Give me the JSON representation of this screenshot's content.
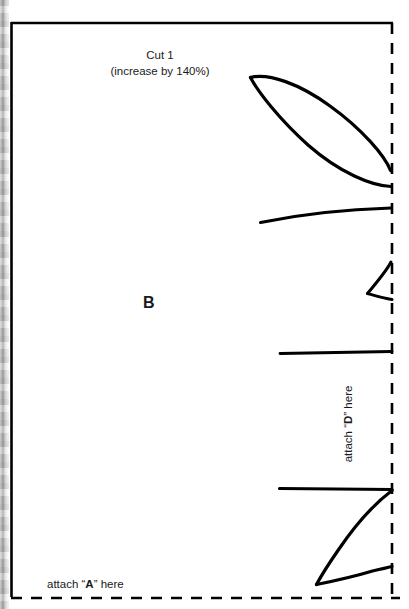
{
  "page": {
    "width": 409,
    "height": 609,
    "background_color": "#ffffff",
    "ink_color": "#000000",
    "text_color": "#1a1a1a"
  },
  "labels": {
    "cut_title": "Cut 1",
    "cut_subtitle": "(increase by 140%)",
    "piece_letter": "B",
    "attach_a_prefix": "attach “",
    "attach_a_letter": "A",
    "attach_a_suffix": "” here",
    "attach_d_prefix": "attach “",
    "attach_d_letter": "D",
    "attach_d_suffix": "” here"
  },
  "frame": {
    "solid_edges": [
      "left",
      "top"
    ],
    "dashed_edges": [
      "right",
      "bottom"
    ],
    "solid_left_x": 11,
    "solid_top_y": 22,
    "dashed_right_x": 392,
    "dashed_bottom_y": 598,
    "dash_length": 11,
    "dash_gap": 9,
    "stroke_width": 2.6
  },
  "shapes": [
    {
      "name": "leaf-outline",
      "kind": "lens",
      "stroke_width": 3.2
    },
    {
      "name": "upper-arc",
      "kind": "arc",
      "stroke_width": 3.2
    },
    {
      "name": "wedge-notch",
      "kind": "wedge",
      "stroke_width": 3.0
    },
    {
      "name": "horizontal-rule",
      "kind": "line",
      "stroke_width": 2.8
    },
    {
      "name": "fin-shape",
      "kind": "fin",
      "stroke_width": 3.2
    }
  ],
  "scan_artifact": {
    "name": "page-gutter-shadow",
    "side": "left",
    "width": 9
  }
}
